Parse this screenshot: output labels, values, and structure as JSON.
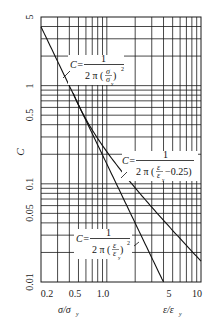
{
  "chart_data": {
    "type": "line",
    "title": "",
    "xscale": "log",
    "yscale": "log",
    "xlabel_left": "σ/σy",
    "xlabel_right": "ε/εy",
    "ylabel": "C",
    "xlim": [
      0.2,
      10
    ],
    "ylim": [
      0.01,
      5
    ],
    "grid": true,
    "x_tick_labels": [
      "0.2",
      "0.5",
      "1.0",
      "5",
      "10"
    ],
    "x_tick_values": [
      0.2,
      0.5,
      1.0,
      5,
      10
    ],
    "y_tick_labels": [
      "5",
      "1",
      "0.5",
      "0.1",
      "0.05",
      "0.01"
    ],
    "y_tick_values": [
      5,
      1,
      0.5,
      0.1,
      0.05,
      0.01
    ],
    "series": [
      {
        "name": "C = 1 / (2π (σ/σy)^2)",
        "formula": "C=1/(2π(σ/σy)^2)",
        "x": [
          0.2,
          0.3,
          0.5,
          0.7,
          1.0,
          1.5,
          2.0,
          3.0,
          4.0
        ],
        "values": [
          3.98,
          1.77,
          0.64,
          0.32,
          0.16,
          0.071,
          0.04,
          0.018,
          0.01
        ]
      },
      {
        "name": "C = 1 / (2π (ε/εy − 0.25))",
        "formula": "C=1/(2π(ε/εy−0.25))",
        "x": [
          0.5,
          0.7,
          1.0,
          1.5,
          2.0,
          3.0,
          5.0,
          7.0,
          10.0
        ],
        "values": [
          0.64,
          0.35,
          0.21,
          0.127,
          0.091,
          0.058,
          0.034,
          0.024,
          0.016
        ]
      },
      {
        "name": "C = 1 / (2π (ε/εy)^2)",
        "formula": "C=1/(2π(ε/εy)^2)",
        "x": [
          1.0,
          2.0,
          3.0,
          4.0
        ],
        "values": [
          0.16,
          0.04,
          0.018,
          0.01
        ]
      }
    ],
    "annotations": [
      {
        "text": "C= 1 / 2π(σ/σy)^2",
        "near": "upper-left curve"
      },
      {
        "text": "C= 1 / 2π(ε/εy −0.25)",
        "near": "right curve"
      },
      {
        "text": "C= 1 / 2π(ε/εy)^2",
        "near": "lower curve"
      }
    ]
  },
  "labels": {
    "y_axis": "C",
    "x_axis_left": "σ/σ",
    "x_axis_left_sub": "y",
    "x_axis_right": "ε/ε",
    "x_axis_right_sub": "y",
    "yticks": [
      "5",
      "1",
      "0.5",
      "0.1",
      "0.05",
      "0.01"
    ],
    "xticks": [
      "0.2",
      "0.5",
      "1.0",
      "5",
      "10"
    ],
    "formula1": {
      "lhs": "C=",
      "num": "1",
      "den_a": "2 π (",
      "den_frac_num": "σ",
      "den_frac_den": "σ",
      "den_sub": "y",
      "den_close": ")",
      "exp": "2"
    },
    "formula2": {
      "lhs": "C=",
      "num": "1",
      "den_a": "2 π (",
      "den_frac_num": "ε",
      "den_frac_den": "ε",
      "den_sub": "y",
      "den_tail": "−0.25)"
    },
    "formula3": {
      "lhs": "C=",
      "num": "1",
      "den_a": "2 π (",
      "den_frac_num": "ε",
      "den_frac_den": "ε",
      "den_sub": "y",
      "den_close": ")",
      "exp": "2"
    }
  }
}
